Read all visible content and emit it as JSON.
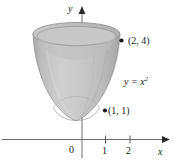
{
  "figure": {
    "kind": "solid-of-revolution-diagram",
    "background_color": "#ffffff",
    "ink_color": "#1a1a1a",
    "solid": {
      "fill_color": "#c3c3c3",
      "edge_color": "#8f8f8f",
      "highlight_color": "#d9d9d9",
      "shadow_color": "#a8a8a8"
    },
    "curve_label": "y = x",
    "curve_exponent": "2",
    "points": [
      {
        "label": "(2, 4)",
        "x_value": 2,
        "y_value": 4
      },
      {
        "label": "(1, 1)",
        "x_value": 1,
        "y_value": 1
      }
    ],
    "axes": {
      "x_name": "x",
      "y_name": "y",
      "origin_label": "0",
      "x_ticks": [
        {
          "label": "1",
          "value": 1
        },
        {
          "label": "2",
          "value": 2
        }
      ]
    }
  }
}
